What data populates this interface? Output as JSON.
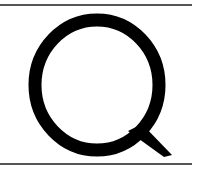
{
  "glyph": {
    "character": "Q",
    "color": "#000000"
  },
  "rules": {
    "color": "#555555"
  }
}
